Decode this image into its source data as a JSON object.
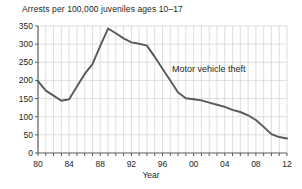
{
  "chart_data": {
    "type": "line",
    "title": "",
    "ylabel": "Arrests per 100,000 juveniles ages 10–17",
    "xlabel": "Year",
    "grid": true,
    "legend_position": "inline-annotation",
    "xlim": [
      1980,
      2012
    ],
    "ylim": [
      0,
      350
    ],
    "y_ticks": [
      0,
      50,
      100,
      150,
      200,
      250,
      300,
      350
    ],
    "y_tick_labels": [
      "0",
      "50",
      "100",
      "150",
      "200",
      "250",
      "300",
      "350"
    ],
    "x_ticks": [
      1980,
      1984,
      1988,
      1992,
      1996,
      2000,
      2004,
      2008,
      2012
    ],
    "x_tick_labels": [
      "80",
      "84",
      "88",
      "92",
      "96",
      "00",
      "04",
      "08",
      "12"
    ],
    "x_minor_tick_step": 1,
    "series": [
      {
        "name": "Motor vehicle theft",
        "color": "#58595b",
        "annotation": "Motor vehicle theft",
        "x": [
          1980,
          1981,
          1982,
          1983,
          1984,
          1985,
          1986,
          1987,
          1988,
          1989,
          1990,
          1991,
          1992,
          1993,
          1994,
          1995,
          1996,
          1997,
          1998,
          1999,
          2000,
          2001,
          2002,
          2003,
          2004,
          2005,
          2006,
          2007,
          2008,
          2009,
          2010,
          2011,
          2012
        ],
        "values": [
          198,
          172,
          158,
          144,
          148,
          183,
          218,
          245,
          295,
          343,
          330,
          316,
          305,
          301,
          296,
          265,
          232,
          200,
          167,
          151,
          148,
          145,
          139,
          133,
          127,
          119,
          113,
          104,
          91,
          72,
          52,
          44,
          40
        ]
      }
    ]
  }
}
